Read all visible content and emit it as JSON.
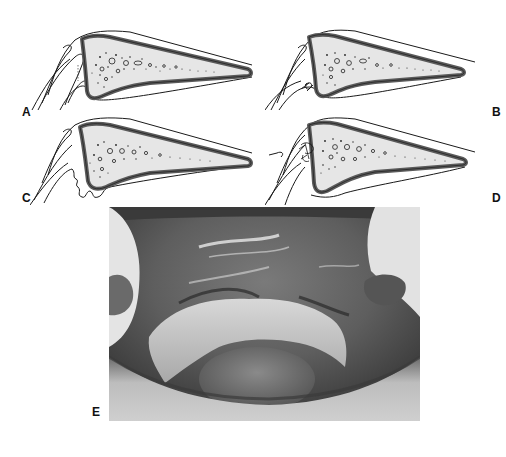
{
  "figure": {
    "panels": [
      {
        "id": "A",
        "label": "A",
        "kind": "diagram",
        "variant": "normal-sulcus",
        "description": "Cross-section of palatal alveolar bone with overlying mucosa"
      },
      {
        "id": "B",
        "label": "B",
        "kind": "diagram",
        "variant": "sutured-flap",
        "description": "Same cross-section with suture at the sulcus"
      },
      {
        "id": "C",
        "label": "C",
        "kind": "diagram",
        "variant": "irregular-tissue",
        "description": "Cross-section with folded/irregular soft tissue at sulcus"
      },
      {
        "id": "D",
        "label": "D",
        "kind": "diagram",
        "variant": "sutured-graft",
        "description": "Cross-section with sutured graft at sulcus"
      },
      {
        "id": "E",
        "label": "E",
        "kind": "photograph",
        "variant": "clinical-intraoral",
        "description": "Grayscale intraoral clinical photograph of maxillary arch"
      }
    ],
    "colors": {
      "background": "#ffffff",
      "outline": "#1a1a1a",
      "cortex": "#5a5a5a",
      "cancellous": "#e6e6e6",
      "label": "#111111"
    }
  }
}
